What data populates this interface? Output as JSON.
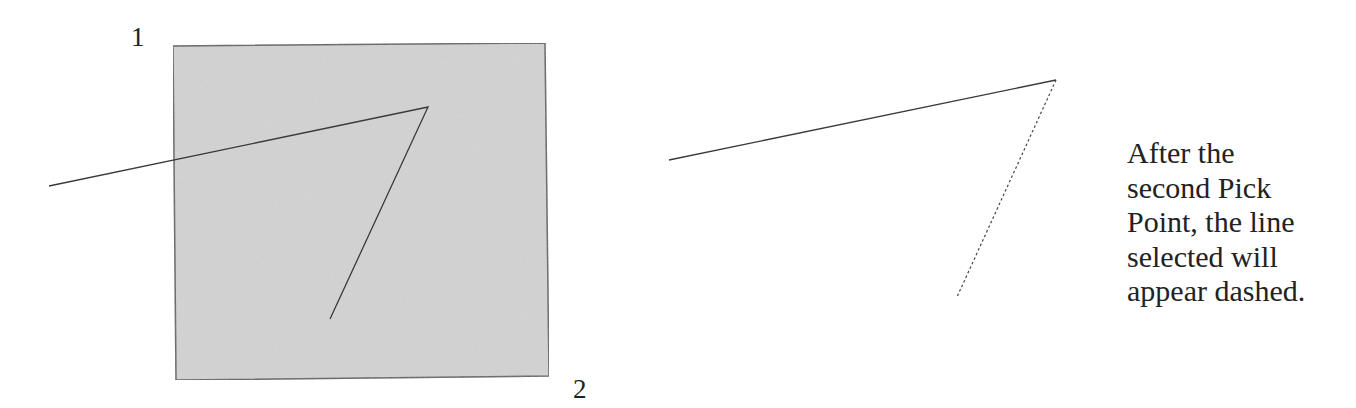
{
  "left_panel": {
    "label_corner_1": "1",
    "label_corner_2": "2",
    "selection_window": {
      "fill": "#d6d6d6",
      "stroke": "#555555",
      "corners": [
        [
          173,
          46
        ],
        [
          545,
          43
        ],
        [
          549,
          376
        ],
        [
          176,
          380
        ]
      ]
    },
    "polyline": {
      "stroke": "#3a3a3a",
      "points": [
        [
          49,
          186
        ],
        [
          428,
          107
        ],
        [
          330,
          319
        ]
      ]
    }
  },
  "right_panel": {
    "solid_segment": {
      "stroke": "#3a3a3a",
      "from": [
        669,
        160
      ],
      "to": [
        1056,
        80
      ]
    },
    "dashed_segment": {
      "stroke": "#444444",
      "from": [
        1056,
        80
      ],
      "to": [
        957,
        297
      ]
    }
  },
  "caption": {
    "lines": [
      "After the",
      "second Pick",
      "Point, the line",
      "selected will",
      "appear dashed."
    ]
  }
}
